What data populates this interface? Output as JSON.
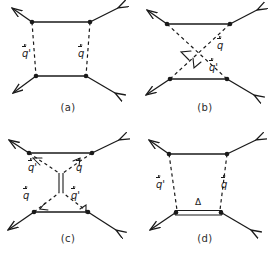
{
  "figure": {
    "title": "",
    "background_color": "#ffffff",
    "line_color": "#1a1a1a",
    "panel_count": 4
  },
  "panels": [
    {
      "id": "a",
      "caption": "(a)",
      "description": "box diagram with two vertical dashed meson exchange lines",
      "labels": [
        {
          "name": "q-prime-left",
          "base": "q",
          "prime": "'",
          "x": 22,
          "y": 50
        },
        {
          "name": "q-right",
          "base": "q",
          "prime": "",
          "x": 78,
          "y": 50
        }
      ]
    },
    {
      "id": "b",
      "caption": "(b)",
      "description": "crossed box diagram with two crossing dashed exchange lines",
      "labels": [
        {
          "name": "q-upper-right",
          "base": "q",
          "prime": "",
          "x": 80,
          "y": 42
        },
        {
          "name": "q-prime-lower-right",
          "base": "q",
          "prime": "'",
          "x": 72,
          "y": 64
        }
      ]
    },
    {
      "id": "c",
      "caption": "(c)",
      "description": "diagram with four dashed lines meeting a central vertical double line",
      "labels": [
        {
          "name": "q-prime-top-left",
          "base": "q",
          "prime": "'",
          "x": 29,
          "y": 35
        },
        {
          "name": "q-top-right",
          "base": "q",
          "prime": "",
          "x": 77,
          "y": 35
        },
        {
          "name": "q-bottom-left",
          "base": "q",
          "prime": "",
          "x": 24,
          "y": 63
        },
        {
          "name": "q-prime-bottom-right",
          "base": "q",
          "prime": "'",
          "x": 72,
          "y": 63
        }
      ]
    },
    {
      "id": "d",
      "caption": "(d)",
      "description": "box diagram with delta double line at the bottom",
      "labels": [
        {
          "name": "q-prime-left",
          "base": "q",
          "prime": "'",
          "x": 21,
          "y": 52
        },
        {
          "name": "q-right",
          "base": "q",
          "prime": "",
          "x": 83,
          "y": 52
        }
      ],
      "delta_label": {
        "name": "delta-symbol",
        "text": "Δ",
        "x": 61,
        "y": 72
      }
    }
  ]
}
